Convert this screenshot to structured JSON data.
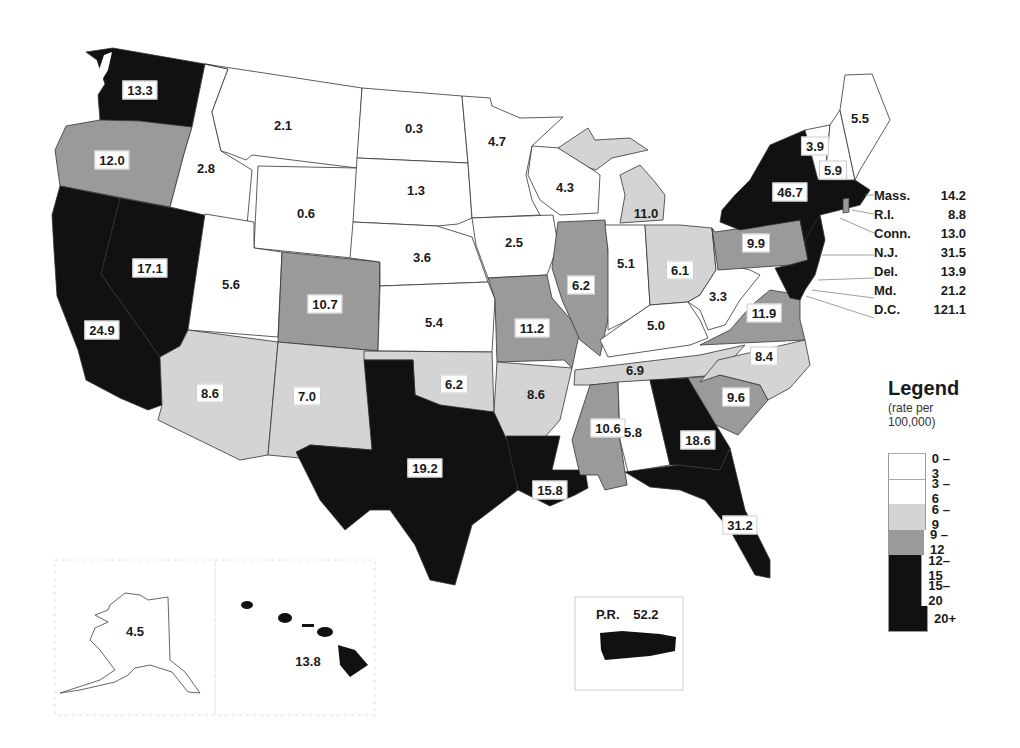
{
  "map": {
    "subject": "rate per 100,000 by state",
    "states": [
      {
        "name": "Washington",
        "abbr": "WA",
        "value": "13.3",
        "class": "12-15"
      },
      {
        "name": "Oregon",
        "abbr": "OR",
        "value": "12.0",
        "class": "9-12"
      },
      {
        "name": "California",
        "abbr": "CA",
        "value": "24.9",
        "class": "20+"
      },
      {
        "name": "Nevada",
        "abbr": "NV",
        "value": "17.1",
        "class": "15-20"
      },
      {
        "name": "Idaho",
        "abbr": "ID",
        "value": "2.8",
        "class": "0-3"
      },
      {
        "name": "Montana",
        "abbr": "MT",
        "value": "2.1",
        "class": "0-3"
      },
      {
        "name": "Wyoming",
        "abbr": "WY",
        "value": "0.6",
        "class": "0-3"
      },
      {
        "name": "Utah",
        "abbr": "UT",
        "value": "5.6",
        "class": "3-6"
      },
      {
        "name": "Colorado",
        "abbr": "CO",
        "value": "10.7",
        "class": "9-12"
      },
      {
        "name": "Arizona",
        "abbr": "AZ",
        "value": "8.6",
        "class": "6-9"
      },
      {
        "name": "New Mexico",
        "abbr": "NM",
        "value": "7.0",
        "class": "6-9"
      },
      {
        "name": "North Dakota",
        "abbr": "ND",
        "value": "0.3",
        "class": "0-3"
      },
      {
        "name": "South Dakota",
        "abbr": "SD",
        "value": "1.3",
        "class": "0-3"
      },
      {
        "name": "Nebraska",
        "abbr": "NE",
        "value": "3.6",
        "class": "3-6"
      },
      {
        "name": "Kansas",
        "abbr": "KS",
        "value": "5.4",
        "class": "3-6"
      },
      {
        "name": "Oklahoma",
        "abbr": "OK",
        "value": "6.2",
        "class": "6-9"
      },
      {
        "name": "Texas",
        "abbr": "TX",
        "value": "19.2",
        "class": "15-20"
      },
      {
        "name": "Minnesota",
        "abbr": "MN",
        "value": "4.7",
        "class": "3-6"
      },
      {
        "name": "Iowa",
        "abbr": "IA",
        "value": "2.5",
        "class": "0-3"
      },
      {
        "name": "Missouri",
        "abbr": "MO",
        "value": "11.2",
        "class": "9-12"
      },
      {
        "name": "Arkansas",
        "abbr": "AR",
        "value": "8.6",
        "class": "6-9"
      },
      {
        "name": "Louisiana",
        "abbr": "LA",
        "value": "15.8",
        "class": "15-20"
      },
      {
        "name": "Wisconsin",
        "abbr": "WI",
        "value": "4.3",
        "class": "3-6"
      },
      {
        "name": "Illinois",
        "abbr": "IL",
        "value": "11.0",
        "class": "9-12"
      },
      {
        "name": "Michigan",
        "abbr": "MI",
        "value": "6.2",
        "class": "6-9"
      },
      {
        "name": "Indiana",
        "abbr": "IN",
        "value": "5.1",
        "class": "3-6"
      },
      {
        "name": "Ohio",
        "abbr": "OH",
        "value": "6.1",
        "class": "6-9"
      },
      {
        "name": "Kentucky",
        "abbr": "KY",
        "value": "5.0",
        "class": "3-6"
      },
      {
        "name": "Tennessee",
        "abbr": "TN",
        "value": "6.9",
        "class": "6-9"
      },
      {
        "name": "Mississippi",
        "abbr": "MS",
        "value": "10.6",
        "class": "9-12"
      },
      {
        "name": "Alabama",
        "abbr": "AL",
        "value": "5.8",
        "class": "3-6"
      },
      {
        "name": "Georgia",
        "abbr": "GA",
        "value": "18.6",
        "class": "15-20"
      },
      {
        "name": "Florida",
        "abbr": "FL",
        "value": "31.2",
        "class": "20+"
      },
      {
        "name": "South Carolina",
        "abbr": "SC",
        "value": "9.6",
        "class": "9-12"
      },
      {
        "name": "North Carolina",
        "abbr": "NC",
        "value": "8.4",
        "class": "6-9"
      },
      {
        "name": "Virginia",
        "abbr": "VA",
        "value": "11.9",
        "class": "9-12"
      },
      {
        "name": "West Virginia",
        "abbr": "WV",
        "value": "3.3",
        "class": "3-6"
      },
      {
        "name": "Pennsylvania",
        "abbr": "PA",
        "value": "9.9",
        "class": "9-12"
      },
      {
        "name": "New York",
        "abbr": "NY",
        "value": "46.7",
        "class": "20+"
      },
      {
        "name": "Vermont",
        "abbr": "VT",
        "value": "3.9",
        "class": "3-6"
      },
      {
        "name": "New Hampshire",
        "abbr": "NH",
        "value": "5.9",
        "class": "3-6"
      },
      {
        "name": "Maine",
        "abbr": "ME",
        "value": "5.5",
        "class": "3-6"
      },
      {
        "name": "Alaska",
        "abbr": "AK",
        "value": "4.5",
        "class": "3-6"
      },
      {
        "name": "Hawaii",
        "abbr": "HI",
        "value": "13.8",
        "class": "12-15"
      }
    ],
    "small_states": [
      {
        "label": "Mass.",
        "value": "14.2"
      },
      {
        "label": "R.I.",
        "value": "8.8"
      },
      {
        "label": "Conn.",
        "value": "13.0"
      },
      {
        "label": "N.J.",
        "value": "31.5"
      },
      {
        "label": "Del.",
        "value": "13.9"
      },
      {
        "label": "Md.",
        "value": "21.2"
      },
      {
        "label": "D.C.",
        "value": "121.1"
      }
    ],
    "puerto_rico": {
      "label": "P.R.",
      "value": "52.2"
    }
  },
  "legend": {
    "title": "Legend",
    "subtitle_line1": "(rate per",
    "subtitle_line2": "100,000)",
    "classes": [
      {
        "label": "0 – 3",
        "color": "#ffffff"
      },
      {
        "label": "3 – 6",
        "color": "#ffffff"
      },
      {
        "label": "6 – 9",
        "color": "#d4d4d4"
      },
      {
        "label": "9 –12",
        "color": "#9a9a9a"
      },
      {
        "label": "12–15",
        "color": "#111111"
      },
      {
        "label": "15–20",
        "color": "#111111"
      },
      {
        "label": "20+",
        "color": "#111111"
      }
    ]
  }
}
